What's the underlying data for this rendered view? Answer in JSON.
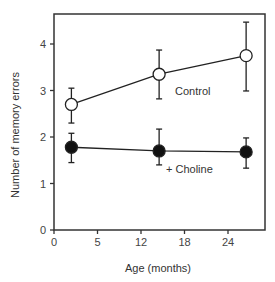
{
  "chart_data": {
    "type": "line",
    "title": "",
    "xlabel": "Age (months)",
    "ylabel": "Number of memory errors",
    "x_ticks": [
      0,
      5,
      12,
      18,
      24
    ],
    "y_ticks": [
      0,
      1,
      2,
      3,
      4
    ],
    "ylim": [
      0,
      4.6
    ],
    "grid": false,
    "legend": "inline labels",
    "series": [
      {
        "name": "Control",
        "marker": "open-circle",
        "x": [
          2,
          14.5,
          26.5
        ],
        "values": [
          2.7,
          3.35,
          3.75
        ],
        "error_low": [
          2.3,
          2.82,
          2.99
        ],
        "error_high": [
          3.05,
          3.87,
          4.47
        ]
      },
      {
        "name": "+ Choline",
        "marker": "filled-circle",
        "x": [
          2,
          14.5,
          26.5
        ],
        "values": [
          1.78,
          1.7,
          1.68
        ],
        "error_low": [
          1.45,
          1.4,
          1.33
        ],
        "error_high": [
          2.08,
          2.17,
          1.98
        ]
      }
    ],
    "annotations": [
      {
        "text": "Control",
        "near_series": "Control"
      },
      {
        "text": "+ Choline",
        "near_series": "+ Choline"
      }
    ]
  },
  "labels": {
    "xlabel": "Age (months)",
    "ylabel": "Number of memory errors",
    "control": "Control",
    "choline": "+ Choline"
  },
  "colors": {
    "axis": "#333333",
    "marker_fill_control": "#ffffff",
    "marker_fill_choline": "#111111"
  }
}
